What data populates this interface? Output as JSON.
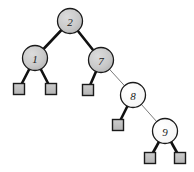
{
  "figure": {
    "name": "binary-tree-diagram",
    "type": "red-black-tree",
    "width": 194,
    "height": 172,
    "background": "#ffffff"
  },
  "style": {
    "internal_gray_fill": "#c9c9c9",
    "internal_white_fill": "#ffffff",
    "node_stroke": "#1a1a1a",
    "leaf_fill": "#bdbdbd",
    "leaf_stroke": "#1a1a1a",
    "edge_thick_color": "#111111",
    "edge_thin_color": "#6b6b6b",
    "edge_thick_width": 2.6,
    "edge_thin_width": 0.9,
    "node_radius": 12.5,
    "leaf_size": 11,
    "label_font_size": 11
  },
  "nodes": [
    {
      "id": "n2",
      "label": "2",
      "cx": 70,
      "cy": 21,
      "r": 12.5,
      "fill": "gray",
      "shape": "circle"
    },
    {
      "id": "n1",
      "label": "1",
      "cx": 35,
      "cy": 58,
      "r": 12.5,
      "fill": "gray",
      "shape": "circle"
    },
    {
      "id": "n7",
      "label": "7",
      "cx": 101,
      "cy": 60,
      "r": 12.5,
      "fill": "gray",
      "shape": "circle"
    },
    {
      "id": "n8",
      "label": "8",
      "cx": 133,
      "cy": 95,
      "r": 12.5,
      "fill": "white",
      "shape": "circle"
    },
    {
      "id": "n9",
      "label": "9",
      "cx": 165,
      "cy": 131,
      "r": 12.5,
      "fill": "white",
      "shape": "circle"
    }
  ],
  "leaves": [
    {
      "id": "l1",
      "parent": "n1",
      "side": "left",
      "cx": 19,
      "cy": 89,
      "size": 11
    },
    {
      "id": "l2",
      "parent": "n1",
      "side": "right",
      "cx": 51,
      "cy": 89,
      "size": 11
    },
    {
      "id": "l3",
      "parent": "n7",
      "side": "left",
      "cx": 88,
      "cy": 90,
      "size": 11
    },
    {
      "id": "l4",
      "parent": "n8",
      "side": "left",
      "cx": 118,
      "cy": 125,
      "size": 11
    },
    {
      "id": "l5",
      "parent": "n9",
      "side": "left",
      "cx": 150,
      "cy": 158,
      "size": 11
    },
    {
      "id": "l6",
      "parent": "n9",
      "side": "right",
      "cx": 180,
      "cy": 158,
      "size": 11
    }
  ],
  "edges": [
    {
      "id": "e-2-1",
      "from": "n2",
      "to": "n1",
      "x1": 70,
      "y1": 21,
      "x2": 35,
      "y2": 58,
      "weight": "thick"
    },
    {
      "id": "e-2-7",
      "from": "n2",
      "to": "n7",
      "x1": 70,
      "y1": 21,
      "x2": 101,
      "y2": 60,
      "weight": "thick"
    },
    {
      "id": "e-1-l1",
      "from": "n1",
      "to": "l1",
      "x1": 35,
      "y1": 58,
      "x2": 19,
      "y2": 89,
      "weight": "thick"
    },
    {
      "id": "e-1-l2",
      "from": "n1",
      "to": "l2",
      "x1": 35,
      "y1": 58,
      "x2": 51,
      "y2": 89,
      "weight": "thick"
    },
    {
      "id": "e-7-l3",
      "from": "n7",
      "to": "l3",
      "x1": 101,
      "y1": 60,
      "x2": 88,
      "y2": 90,
      "weight": "thick"
    },
    {
      "id": "e-7-8",
      "from": "n7",
      "to": "n8",
      "x1": 101,
      "y1": 60,
      "x2": 133,
      "y2": 95,
      "weight": "thin"
    },
    {
      "id": "e-8-l4",
      "from": "n8",
      "to": "l4",
      "x1": 133,
      "y1": 95,
      "x2": 118,
      "y2": 125,
      "weight": "thick"
    },
    {
      "id": "e-8-9",
      "from": "n8",
      "to": "n9",
      "x1": 133,
      "y1": 95,
      "x2": 165,
      "y2": 131,
      "weight": "thin"
    },
    {
      "id": "e-9-l5",
      "from": "n9",
      "to": "l5",
      "x1": 165,
      "y1": 131,
      "x2": 150,
      "y2": 158,
      "weight": "thick"
    },
    {
      "id": "e-9-l6",
      "from": "n9",
      "to": "l6",
      "x1": 165,
      "y1": 131,
      "x2": 180,
      "y2": 158,
      "weight": "thick"
    }
  ]
}
